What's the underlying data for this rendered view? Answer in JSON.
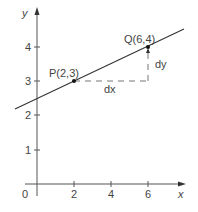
{
  "diagram": {
    "type": "coordinate-graph",
    "axes": {
      "x_label": "x",
      "y_label": "y",
      "origin_label": "0",
      "x_ticks": [
        "2",
        "4",
        "6"
      ],
      "y_ticks": [
        "1",
        "2",
        "3",
        "4"
      ]
    },
    "line": {
      "description": "straight line through P and Q",
      "slope": 0.25,
      "intercept": 2.5
    },
    "points": [
      {
        "id": "P",
        "label": "P(2,3)",
        "x": 2,
        "y": 3
      },
      {
        "id": "Q",
        "label": "Q(6,4)",
        "x": 6,
        "y": 4
      }
    ],
    "annotations": {
      "dx_label": "dx",
      "dy_label": "dy"
    },
    "colors": {
      "axis": "#555555",
      "line": "#333333",
      "dashed": "#777777",
      "point": "#111111"
    }
  }
}
